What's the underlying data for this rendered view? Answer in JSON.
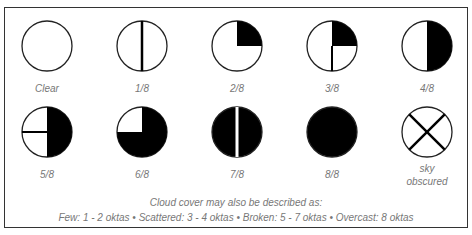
{
  "symbols": [
    {
      "label": "Clear",
      "fraction": 0
    },
    {
      "label": "1/8",
      "fraction": 1
    },
    {
      "label": "2/8",
      "fraction": 2
    },
    {
      "label": "3/8",
      "fraction": 3
    },
    {
      "label": "4/8",
      "fraction": 4
    },
    {
      "label": "5/8",
      "fraction": 5
    },
    {
      "label": "6/8",
      "fraction": 6
    },
    {
      "label": "7/8",
      "fraction": 7
    },
    {
      "label": "8/8",
      "fraction": 8
    },
    {
      "label_line1": "sky",
      "label_line2": "obscured",
      "fraction": "obscured"
    }
  ],
  "note": {
    "line1": "Cloud cover may also be described as:",
    "line2": "Few: 1 - 2 oktas • Scattered: 3 - 4 oktas • Broken: 5 - 7 oktas • Overcast: 8 oktas"
  },
  "colors": {
    "fill": "#000000",
    "stroke": "#222222",
    "label": "#777777"
  }
}
